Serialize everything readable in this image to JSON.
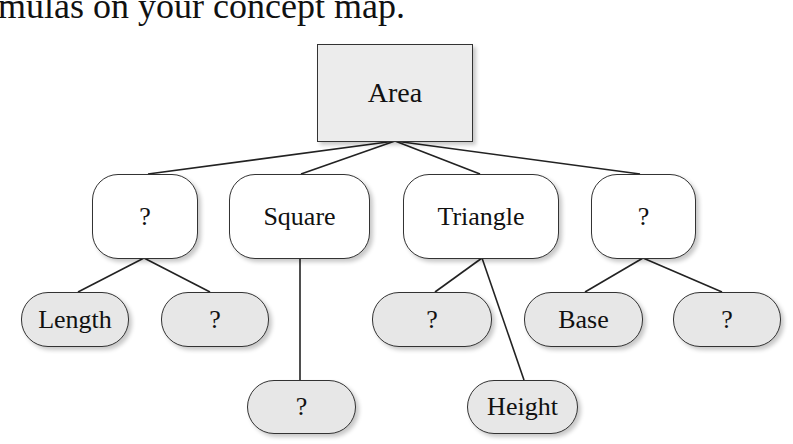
{
  "caption": "mulas on your concept map.",
  "diagram": {
    "root": {
      "label": "Area"
    },
    "level2": [
      {
        "label": "?"
      },
      {
        "label": "Square"
      },
      {
        "label": "Triangle"
      },
      {
        "label": "?"
      }
    ],
    "leaves": [
      {
        "label": "Length",
        "parent": "?"
      },
      {
        "label": "?",
        "parent": "?"
      },
      {
        "label": "?",
        "parent": "Square"
      },
      {
        "label": "?",
        "parent": "Triangle"
      },
      {
        "label": "Height",
        "parent": "Triangle"
      },
      {
        "label": "Base",
        "parent": "?"
      },
      {
        "label": "?",
        "parent": "?"
      }
    ],
    "colors": {
      "root_fill": "#ececec",
      "mid_fill": "#ffffff",
      "leaf_fill": "#e7e7e7",
      "stroke": "#333333"
    }
  }
}
